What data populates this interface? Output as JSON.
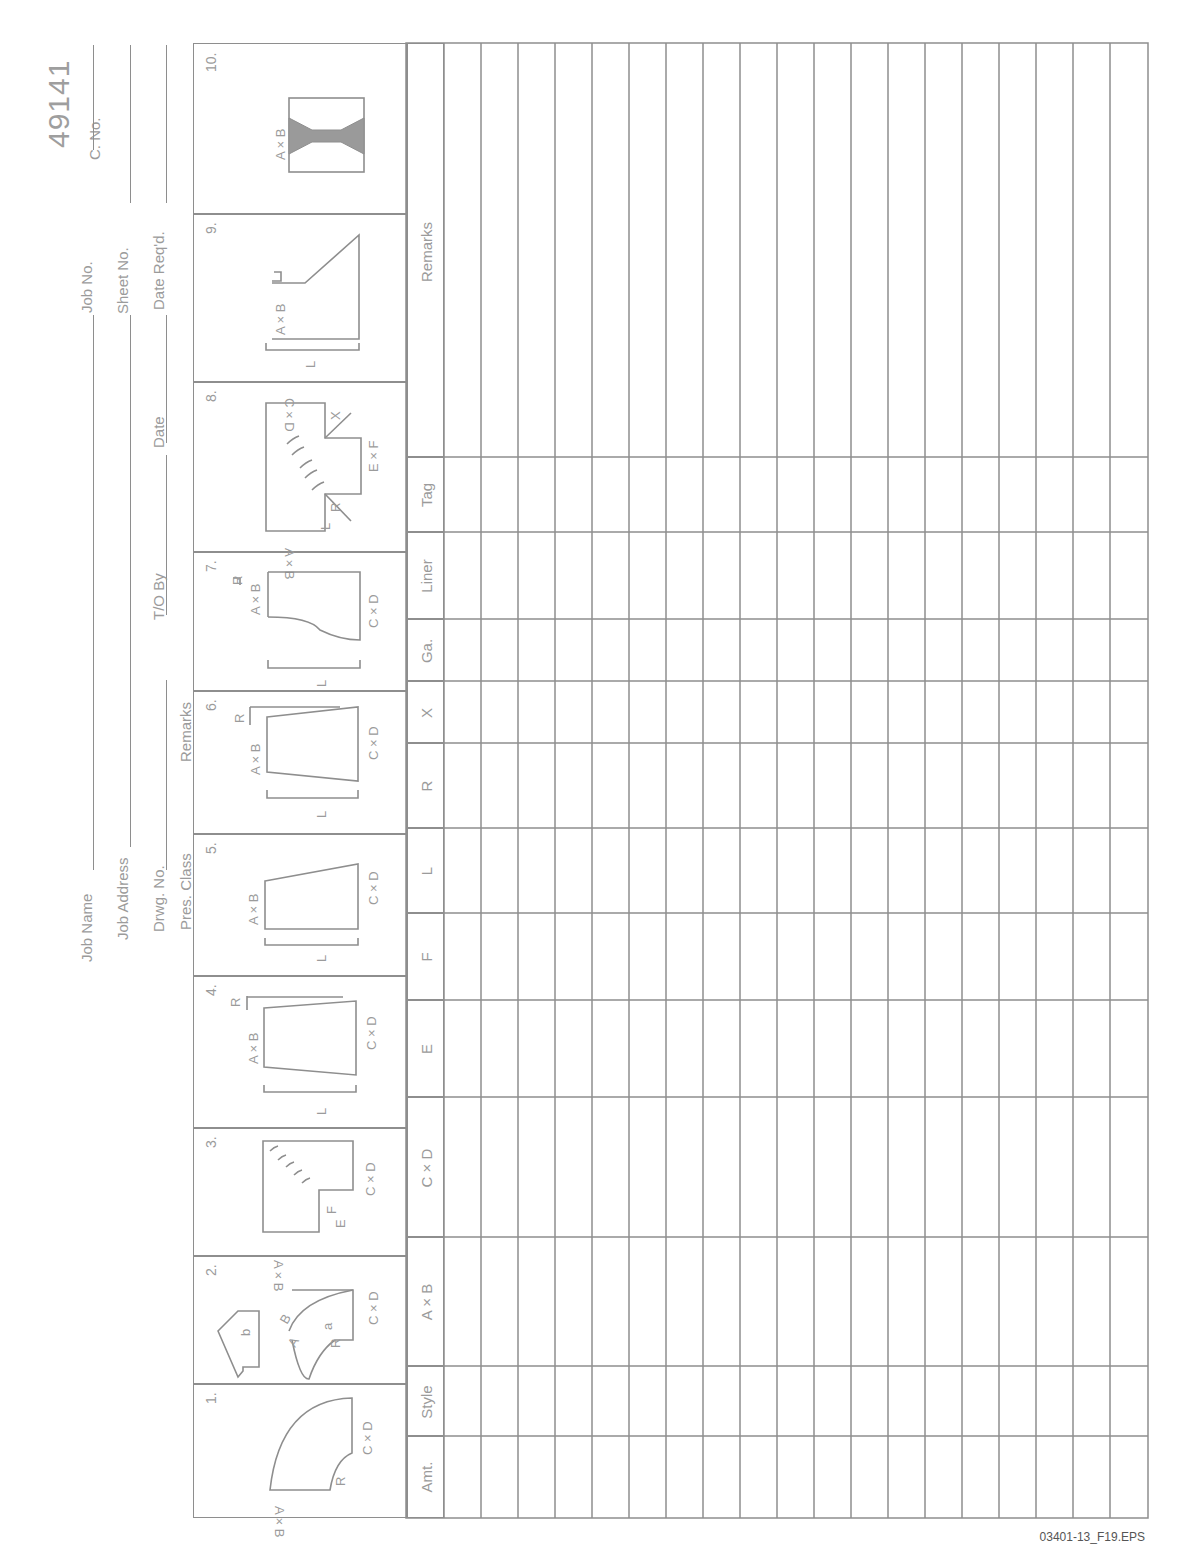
{
  "document": {
    "number": "49141",
    "footer_ref": "03401-13_F19.EPS"
  },
  "header_fields": {
    "job_name": "Job Name",
    "job_address": "Job Address",
    "drwg_no": "Drwg. No.",
    "pres_class": "Pres. Class",
    "remarks": "Remarks",
    "t_o_by": "T/O By",
    "date": "Date",
    "job_no": "Job No.",
    "sheet_no": "Sheet No.",
    "date_reqd": "Date Req'd.",
    "c_no": "C. No."
  },
  "figures": [
    {
      "num": "1.",
      "labels": [
        "A × B",
        "R",
        "C × D"
      ]
    },
    {
      "num": "2.",
      "labels": [
        "b",
        "a",
        "A",
        "B",
        "R",
        "C × D"
      ]
    },
    {
      "num": "3.",
      "labels": [
        "A × B",
        "F",
        "E",
        "C × D"
      ]
    },
    {
      "num": "4.",
      "labels": [
        "A × B",
        "R",
        "C × D",
        "L"
      ]
    },
    {
      "num": "5.",
      "labels": [
        "A × B",
        "C × D",
        "L"
      ]
    },
    {
      "num": "6.",
      "labels": [
        "A × B",
        "R",
        "C × D",
        "L"
      ]
    },
    {
      "num": "7.",
      "labels": [
        "A × B",
        "R",
        "C × D",
        "L"
      ]
    },
    {
      "num": "8.",
      "labels": [
        "A × B",
        "C × D",
        "E × F",
        "L",
        "R",
        "X"
      ]
    },
    {
      "num": "9.",
      "labels": [
        "A × B",
        "L"
      ]
    },
    {
      "num": "10.",
      "labels": [
        "A × B"
      ]
    }
  ],
  "table": {
    "columns": [
      "Amt.",
      "Style",
      "A × B",
      "C × D",
      "E",
      "F",
      "L",
      "R",
      "X",
      "Ga.",
      "Liner",
      "Tag",
      "Remarks"
    ],
    "row_count": 20,
    "rows": []
  },
  "colors": {
    "line": "#8e8e8e",
    "text": "#9b9b9b",
    "fill_fig10": "#9a9a9a"
  }
}
